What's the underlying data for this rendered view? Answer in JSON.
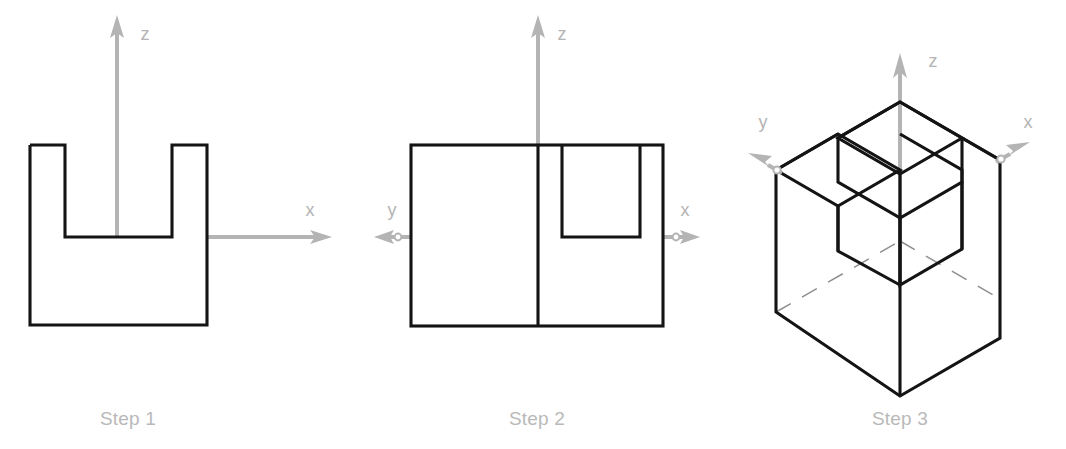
{
  "figure": {
    "background_color": "#ffffff",
    "solid_line_color": "#141414",
    "hidden_line_color": "#8e8e8e",
    "axis_color": "#b4b4b4",
    "caption_color": "#b9b9b9"
  },
  "steps": [
    {
      "id": "step-1",
      "caption": "Step 1",
      "caption_pos": {
        "x": 128,
        "y": 425
      },
      "description": "Front view: U-shaped profile sketch on the x-z plane",
      "axes": [
        {
          "name": "z",
          "label": "z",
          "label_pos": {
            "x": 145,
            "y": 40
          },
          "direction": "up"
        },
        {
          "name": "x",
          "label": "x",
          "label_pos": {
            "x": 310,
            "y": 216
          },
          "direction": "right"
        }
      ],
      "profile": {
        "type": "u-shape",
        "outline_points": "30,145 30,325 207,325 207,145 172,145 172,237 65,237 65,145 30,145",
        "left": 30,
        "right": 207,
        "top": 145,
        "bottom": 325,
        "notch_left": 65,
        "notch_right": 172,
        "notch_bottom": 237
      }
    },
    {
      "id": "step-2",
      "caption": "Step 2",
      "caption_pos": {
        "x": 537,
        "y": 425
      },
      "description": "Top view: rectangle with center divider and nested U-notch",
      "axes": [
        {
          "name": "z",
          "label": "z",
          "label_pos": {
            "x": 562,
            "y": 40
          },
          "direction": "up"
        },
        {
          "name": "y",
          "label": "y",
          "label_pos": {
            "x": 392,
            "y": 216
          },
          "direction": "left"
        },
        {
          "name": "x",
          "label": "x",
          "label_pos": {
            "x": 685,
            "y": 216
          },
          "direction": "right"
        }
      ],
      "profile": {
        "type": "rectangle-with-notch",
        "outer_rect": {
          "left": 411,
          "top": 145,
          "right": 663,
          "bottom": 326
        },
        "divider_x": 538,
        "notch_points": "538,145 538,237 640,237 640,145",
        "notch_left": 538,
        "notch_right": 640,
        "notch_bottom": 237
      }
    },
    {
      "id": "step-3",
      "caption": "Step 3",
      "caption_pos": {
        "x": 900,
        "y": 425
      },
      "description": "Isometric view: extruded U-channel solid with hidden edges",
      "axes": [
        {
          "name": "z",
          "label": "z",
          "label_pos": {
            "x": 933,
            "y": 67
          },
          "direction": "up"
        },
        {
          "name": "y",
          "label": "y",
          "label_pos": {
            "x": 763,
            "y": 128
          },
          "direction": "up-left"
        },
        {
          "name": "x",
          "label": "x",
          "label_pos": {
            "x": 1028,
            "y": 128
          },
          "direction": "up-right"
        }
      ],
      "solid": {
        "type": "u-channel-isometric",
        "left_vertex_x": 776,
        "right_vertex_x": 1000,
        "bottom_vertex": {
          "x": 900,
          "y": 396
        },
        "has_hidden_dashed_lines": true
      }
    }
  ]
}
